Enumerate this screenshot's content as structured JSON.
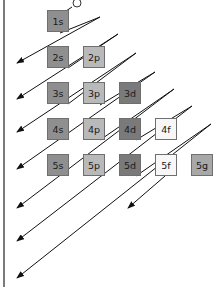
{
  "diagram": {
    "orbitals": [
      {
        "label": "1s",
        "row": 0,
        "col": 0,
        "type": "s"
      },
      {
        "label": "2s",
        "row": 1,
        "col": 0,
        "type": "s"
      },
      {
        "label": "2p",
        "row": 1,
        "col": 1,
        "type": "p"
      },
      {
        "label": "3s",
        "row": 2,
        "col": 0,
        "type": "s"
      },
      {
        "label": "3p",
        "row": 2,
        "col": 1,
        "type": "p"
      },
      {
        "label": "3d",
        "row": 2,
        "col": 2,
        "type": "d"
      },
      {
        "label": "4s",
        "row": 3,
        "col": 0,
        "type": "s"
      },
      {
        "label": "4p",
        "row": 3,
        "col": 1,
        "type": "p"
      },
      {
        "label": "4d",
        "row": 3,
        "col": 2,
        "type": "d"
      },
      {
        "label": "4f",
        "row": 3,
        "col": 3,
        "type": "f"
      },
      {
        "label": "5s",
        "row": 4,
        "col": 0,
        "type": "s"
      },
      {
        "label": "5p",
        "row": 4,
        "col": 1,
        "type": "p"
      },
      {
        "label": "5d",
        "row": 4,
        "col": 2,
        "type": "d"
      },
      {
        "label": "5f",
        "row": 4,
        "col": 3,
        "type": "f"
      },
      {
        "label": "5g",
        "row": 4,
        "col": 4,
        "type": "g"
      }
    ],
    "colors": {
      "s": "#8f8f8f",
      "p": "#b9b9b9",
      "d": "#7a7a7a",
      "f": "#f7f7f7",
      "g": "#a8a8a8",
      "line": "#111111"
    }
  }
}
